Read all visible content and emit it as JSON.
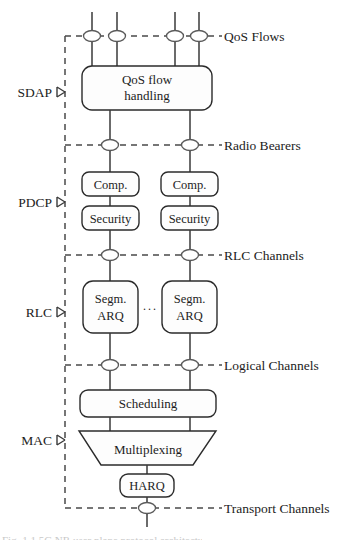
{
  "figure": {
    "background_color": "#ffffff",
    "line_color": "#3a3a3a",
    "dashed_color": "#4a4a4a",
    "box_fill": "#fdfdfd",
    "text_color": "#1c1c1c"
  },
  "layers": [
    {
      "id": "sdap",
      "label": "SDAP",
      "x": 55,
      "y": 92
    },
    {
      "id": "pdcp",
      "label": "PDCP",
      "x": 55,
      "y": 202
    },
    {
      "id": "rlc",
      "label": "RLC",
      "x": 55,
      "y": 312
    },
    {
      "id": "mac",
      "label": "MAC",
      "x": 55,
      "y": 440
    }
  ],
  "channels": [
    {
      "id": "qos-flows",
      "label": "QoS Flows",
      "y": 36,
      "x": 224
    },
    {
      "id": "radio-bearers",
      "label": "Radio Bearers",
      "y": 145,
      "x": 224
    },
    {
      "id": "rlc-channels",
      "label": "RLC Channels",
      "y": 255,
      "x": 224
    },
    {
      "id": "logical-channels",
      "label": "Logical Channels",
      "y": 365,
      "x": 224
    },
    {
      "id": "transport-channels",
      "label": "Transport Channels",
      "y": 508,
      "x": 224
    }
  ],
  "blocks": [
    {
      "id": "qos-flow-handling",
      "line1": "QoS flow",
      "line2": "handling"
    },
    {
      "id": "comp-left",
      "label": "Comp."
    },
    {
      "id": "comp-right",
      "label": "Comp."
    },
    {
      "id": "security-left",
      "label": "Security"
    },
    {
      "id": "security-right",
      "label": "Security"
    },
    {
      "id": "segm-arq-left",
      "line1": "Segm.",
      "line2": "ARQ"
    },
    {
      "id": "segm-arq-right",
      "line1": "Segm.",
      "line2": "ARQ"
    },
    {
      "id": "scheduling",
      "label": "Scheduling"
    },
    {
      "id": "multiplexing",
      "label": "Multiplexing"
    },
    {
      "id": "harq",
      "label": "HARQ"
    }
  ],
  "ellipsis": {
    "label": "···"
  },
  "flow_nodes": {
    "qos_flow_x": [
      92,
      117,
      175,
      199
    ],
    "bearer_x": [
      110,
      190
    ],
    "transport_x": [
      146
    ]
  },
  "caption_sliver": {
    "text": "Fig. 1.1  5G NR user plane protocol architecture"
  }
}
